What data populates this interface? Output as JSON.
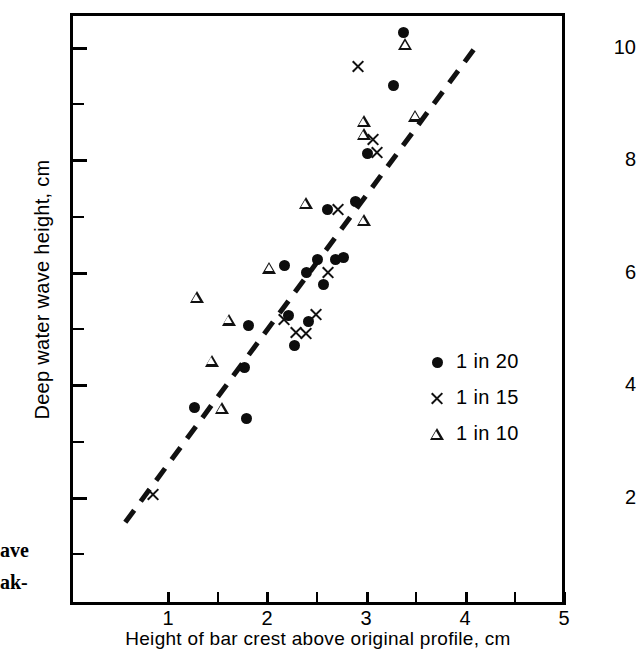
{
  "chart_data": {
    "type": "scatter",
    "title": "",
    "xlabel": "Height of bar crest  above original profile, cm",
    "ylabel": "Deep water wave height, cm",
    "xlim": [
      0.33,
      5.3
    ],
    "ylim": [
      0.25,
      10.75
    ],
    "xticks": [
      1,
      2,
      3,
      4,
      5
    ],
    "yticks": [
      2,
      4,
      6,
      8,
      10
    ],
    "xminorticks": [
      1.5,
      2.5,
      3.5,
      4.5
    ],
    "yminorticks": [
      1,
      3,
      5,
      7,
      9
    ],
    "grid": false,
    "legend_position": "center-right",
    "series": [
      {
        "name": "1 in 20",
        "marker": "filled-circle",
        "color": "#0d0d0d",
        "points": [
          [
            1.28,
            3.6
          ],
          [
            1.8,
            3.4
          ],
          [
            1.78,
            4.3
          ],
          [
            1.82,
            5.05
          ],
          [
            2.22,
            5.22
          ],
          [
            2.28,
            4.7
          ],
          [
            2.42,
            5.12
          ],
          [
            2.18,
            6.12
          ],
          [
            2.4,
            6.0
          ],
          [
            2.52,
            6.22
          ],
          [
            2.58,
            5.77
          ],
          [
            2.7,
            6.22
          ],
          [
            2.78,
            6.25
          ],
          [
            2.9,
            7.25
          ],
          [
            2.62,
            7.12
          ],
          [
            3.02,
            8.1
          ],
          [
            3.28,
            9.32
          ],
          [
            3.38,
            10.25
          ]
        ]
      },
      {
        "name": "1 in 15",
        "marker": "cross",
        "color": "#111111",
        "points": [
          [
            0.86,
            2.05
          ],
          [
            2.18,
            5.15
          ],
          [
            2.3,
            4.92
          ],
          [
            2.4,
            4.9
          ],
          [
            2.5,
            5.25
          ],
          [
            2.62,
            6.0
          ],
          [
            2.72,
            7.12
          ],
          [
            2.92,
            9.65
          ],
          [
            3.08,
            8.35
          ],
          [
            3.12,
            8.12
          ]
        ]
      },
      {
        "name": "1 in 10",
        "marker": "open-triangle",
        "color": "#111111",
        "points": [
          [
            1.3,
            5.55
          ],
          [
            1.45,
            4.42
          ],
          [
            1.55,
            3.58
          ],
          [
            1.62,
            5.15
          ],
          [
            2.03,
            6.08
          ],
          [
            2.4,
            7.22
          ],
          [
            2.98,
            6.92
          ],
          [
            2.98,
            8.68
          ],
          [
            2.98,
            8.45
          ],
          [
            3.4,
            10.05
          ],
          [
            3.5,
            8.78
          ]
        ]
      }
    ],
    "trendline": {
      "style": "dashed",
      "x_start": 0.58,
      "y_start": 1.55,
      "x_end": 4.1,
      "y_end": 9.98
    }
  },
  "axis": {
    "y_tick_labels": [
      "10",
      "8",
      "6",
      "4",
      "2"
    ],
    "x_tick_labels": [
      "1",
      "2",
      "3",
      "4",
      "5"
    ],
    "y_title": "Deep water wave height, cm",
    "x_title": "Height of bar crest  above original profile, cm"
  },
  "legend": {
    "items": [
      {
        "marker": "filled-circle",
        "label": "1 in 20"
      },
      {
        "marker": "cross",
        "label": "1 in 15"
      },
      {
        "marker": "open-triangle",
        "label": "1 in 10"
      }
    ]
  },
  "caption_fragment": {
    "line1": "ave",
    "line2": "ak-"
  }
}
